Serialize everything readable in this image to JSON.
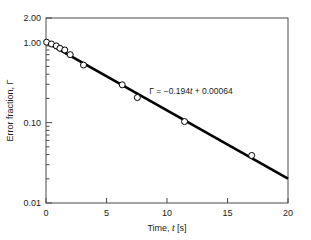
{
  "chart_data": {
    "type": "scatter",
    "title": "",
    "xlabel": "Time, t [s]",
    "ylabel": "Error fraction, Γ",
    "xlabel_parts": {
      "pre": "Time, ",
      "italic": "t",
      "post": " [s]"
    },
    "xlim": [
      0,
      20
    ],
    "ylim": [
      0.01,
      2.0
    ],
    "yscale": "log",
    "xscale": "linear",
    "grid": false,
    "legend": null,
    "xticks": [
      0,
      5,
      10,
      15,
      20
    ],
    "xticklabels": [
      "0",
      "5",
      "10",
      "15",
      "20"
    ],
    "yticks": [
      0.01,
      0.1,
      1.0,
      2.0
    ],
    "yticklabels": [
      "0.01",
      "0.10",
      "1.00",
      "2.00"
    ],
    "minor_yticks": [
      0.02,
      0.03,
      0.04,
      0.05,
      0.06,
      0.07,
      0.08,
      0.09,
      0.2,
      0.3,
      0.4,
      0.5,
      0.6,
      0.7,
      0.8,
      0.9
    ],
    "marker_style": "open-circle",
    "points": [
      {
        "x": 0.05,
        "y": 1.0
      },
      {
        "x": 0.45,
        "y": 0.95
      },
      {
        "x": 0.85,
        "y": 0.9
      },
      {
        "x": 1.15,
        "y": 0.84
      },
      {
        "x": 1.55,
        "y": 0.8
      },
      {
        "x": 2.0,
        "y": 0.7
      },
      {
        "x": 3.1,
        "y": 0.52
      },
      {
        "x": 6.3,
        "y": 0.295
      },
      {
        "x": 7.55,
        "y": 0.205
      },
      {
        "x": 11.45,
        "y": 0.103
      },
      {
        "x": 17.0,
        "y": 0.039
      }
    ],
    "fit": {
      "equation_text": "Γ = −0.194t + 0.00064",
      "equation_parts": {
        "pre": "Γ = −0.194",
        "italic": "t",
        "post": " + 0.00064"
      },
      "slope": -0.194,
      "intercept": 0.00064,
      "model": "log10(Γ) = -0.194*t + 0.00064",
      "x_start": 0,
      "x_end": 20,
      "y_start": 1.0015,
      "y_end": 0.0201
    },
    "colors": {
      "line": "#000000",
      "marker_face": "#ffffff",
      "marker_edge": "#000000",
      "axis": "#4a4a4a",
      "text": "#1a1a1a",
      "background": "#ffffff"
    }
  }
}
